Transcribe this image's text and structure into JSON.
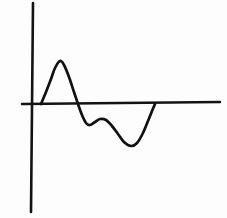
{
  "figure": {
    "background_color": "#fdfdfd",
    "ink_color": "#111111",
    "style": "hand-drawn line sketch",
    "width": 227,
    "height": 218
  },
  "axes": {
    "vertical": {
      "name": "y-axis",
      "x_top": 33,
      "y_top": 3,
      "x_bottom": 31,
      "y_bottom": 212,
      "stroke_width": 2.6,
      "color": "#131313"
    },
    "horizontal": {
      "name": "x-axis-baseline",
      "x_start": 22,
      "y_start": 104,
      "x_end": 220,
      "y_end": 102,
      "stroke_width": 2.4,
      "color": "#131313"
    },
    "origin": {
      "x": 32,
      "y": 104
    },
    "tick_labels": [],
    "axis_labels": {
      "x": "",
      "y": ""
    }
  },
  "chart_data": {
    "type": "line",
    "title": "",
    "subtitle": "",
    "xlabel": "",
    "ylabel": "",
    "grid": false,
    "legend": null,
    "legend_position": "none",
    "axis_ranges": {
      "xlim": [
        0,
        227
      ],
      "ylim": [
        218,
        0
      ]
    },
    "baseline_y": 104,
    "series": [
      {
        "name": "waveform",
        "color": "#111111",
        "stroke_width": 2.7,
        "description": "single damped oscillation: sharp positive lobe, shallow negative dip, small secondary bump, deep negative lobe, return to baseline",
        "points": [
          {
            "x": 41,
            "y": 104
          },
          {
            "x": 46,
            "y": 92
          },
          {
            "x": 51,
            "y": 79
          },
          {
            "x": 55,
            "y": 68
          },
          {
            "x": 60,
            "y": 61
          },
          {
            "x": 64,
            "y": 65
          },
          {
            "x": 69,
            "y": 77
          },
          {
            "x": 74,
            "y": 92
          },
          {
            "x": 78,
            "y": 104
          },
          {
            "x": 82,
            "y": 115
          },
          {
            "x": 86,
            "y": 123
          },
          {
            "x": 90,
            "y": 125
          },
          {
            "x": 95,
            "y": 122
          },
          {
            "x": 100,
            "y": 119
          },
          {
            "x": 106,
            "y": 120
          },
          {
            "x": 112,
            "y": 126
          },
          {
            "x": 118,
            "y": 134
          },
          {
            "x": 124,
            "y": 142
          },
          {
            "x": 131,
            "y": 146
          },
          {
            "x": 137,
            "y": 143
          },
          {
            "x": 143,
            "y": 133
          },
          {
            "x": 148,
            "y": 121
          },
          {
            "x": 152,
            "y": 111
          },
          {
            "x": 155,
            "y": 104
          }
        ],
        "features": [
          {
            "name": "zero-crossing-rise",
            "x": 41,
            "y": 104
          },
          {
            "name": "positive-peak",
            "x": 60,
            "y": 61,
            "amplitude": 43
          },
          {
            "name": "zero-crossing-fall",
            "x": 78,
            "y": 104
          },
          {
            "name": "shallow-trough",
            "x": 89,
            "y": 125,
            "amplitude": -21
          },
          {
            "name": "secondary-bump",
            "x": 100,
            "y": 119,
            "amplitude": -15
          },
          {
            "name": "deep-trough",
            "x": 131,
            "y": 146,
            "amplitude": -42
          },
          {
            "name": "return-to-baseline",
            "x": 155,
            "y": 104
          }
        ]
      }
    ]
  }
}
